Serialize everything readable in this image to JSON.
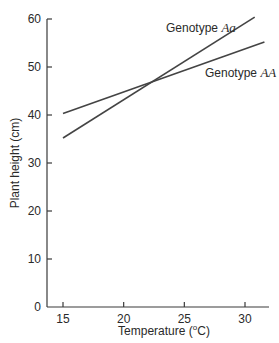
{
  "chart_data": {
    "type": "line",
    "title": "",
    "xlabel": "Temperature (°C)",
    "xlabel_parts": {
      "prefix": "Temperature (",
      "sup": "o",
      "suffix": "C)"
    },
    "ylabel": "Plant height (cm)",
    "xlim": [
      14,
      31.8
    ],
    "ylim": [
      0,
      60
    ],
    "x_ticks": [
      15,
      20,
      25,
      30
    ],
    "y_ticks": [
      0,
      10,
      20,
      30,
      40,
      50,
      60
    ],
    "grid": false,
    "legend": "inline labels near line ends",
    "series": [
      {
        "name": "Genotype Aa",
        "label_prefix": "Genotype ",
        "label_italic": "Aa",
        "x": [
          15,
          30.8
        ],
        "y": [
          35.2,
          60.4
        ]
      },
      {
        "name": "Genotype AA",
        "label_prefix": "Genotype ",
        "label_italic": "AA",
        "x": [
          15,
          31.6
        ],
        "y": [
          40.3,
          55.2
        ]
      }
    ],
    "annotations": [
      {
        "text": "Lines cross at approx. 22.2 °C, 46.9 cm"
      }
    ]
  }
}
